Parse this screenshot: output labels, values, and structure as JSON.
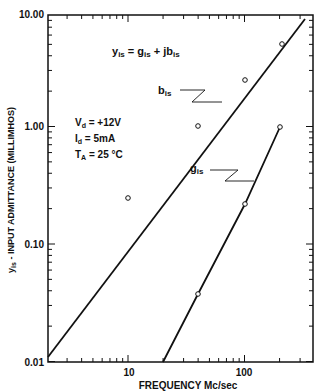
{
  "chart_data": {
    "type": "line",
    "title": "",
    "equation": "y_is = g_is + j b_is",
    "xlabel": "FREQUENCY  Mc/sec",
    "ylabel": "y_is - INPUT ADMITTANCE (MILLIMHOS)",
    "xscale": "log",
    "yscale": "log",
    "xlim": [
      2,
      400
    ],
    "ylim": [
      0.01,
      10
    ],
    "x_ticks": [
      "10",
      "100"
    ],
    "y_ticks": [
      "0.01",
      "0.10",
      "1.00",
      "10.00"
    ],
    "grid": false,
    "conditions": [
      "Vd = +12V",
      "Id = 5mA",
      "TA = 25 °C"
    ],
    "series": [
      {
        "name": "b_is",
        "points": [
          [
            10,
            0.25
          ],
          [
            40,
            0.97
          ],
          [
            100,
            2.4
          ],
          [
            200,
            4.8
          ]
        ],
        "line": [
          [
            2,
            0.055
          ],
          [
            350,
            7.5
          ]
        ]
      },
      {
        "name": "g_is",
        "points": [
          [
            40,
            0.038
          ],
          [
            100,
            0.22
          ],
          [
            200,
            0.97
          ]
        ],
        "line": [
          [
            20,
            0.01
          ],
          [
            200,
            0.97
          ]
        ]
      }
    ]
  },
  "labels": {
    "eq_y": "y",
    "eq_rest": " = g",
    "eq_plus": " + jb",
    "sub_is": "is",
    "vd": "V",
    "vd_sub": "d",
    "vd_val": " = +12V",
    "id": "I",
    "id_sub": "d",
    "id_val": " = 5mA",
    "ta": "T",
    "ta_sub": "A",
    "ta_val": " = 25 °C",
    "bis": "b",
    "gis": "g",
    "x10": "10",
    "x100": "100",
    "y001": "0.01",
    "y010": "0.10",
    "y100": "1.00",
    "y1000": "10.00",
    "xlabel": "FREQUENCY   Mc/sec",
    "ylabel_y": "y",
    "ylabel_rest": " - INPUT  ADMITTANCE  (MILLIMHOS)"
  }
}
